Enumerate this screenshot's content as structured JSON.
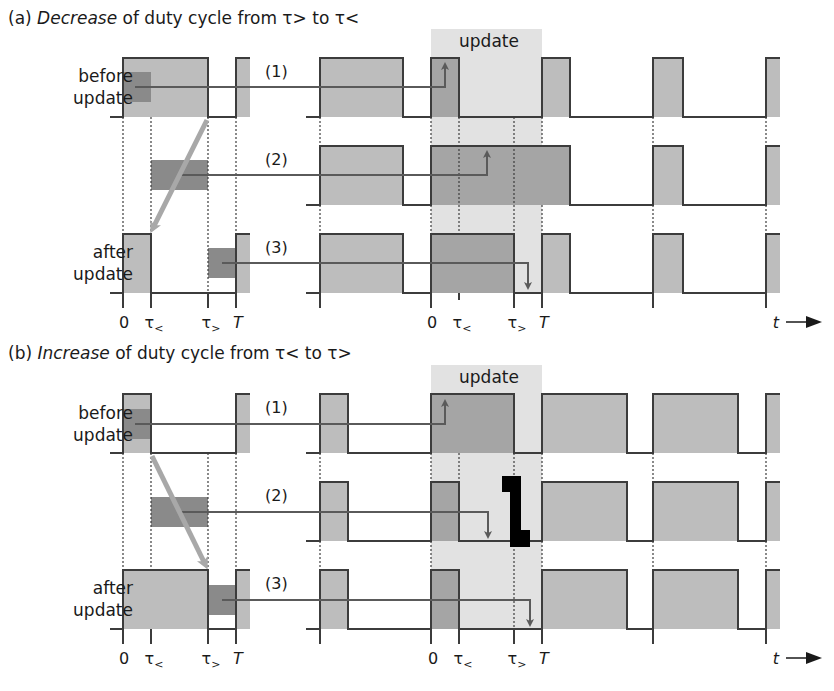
{
  "panel_a": {
    "title_prefix": "(a) ",
    "title_emph": "Decrease",
    "title_rest": " of duty cycle from τ> to τ<",
    "row_labels": {
      "before_1": "before",
      "before_2": "update",
      "after_1": "after",
      "after_2": "update"
    },
    "cases": [
      "(1)",
      "(2)",
      "(3)"
    ],
    "update_label": "update",
    "ticks_left": [
      "0",
      "τ<",
      "τ>",
      "T"
    ],
    "ticks_right": [
      "0",
      "τ<",
      "τ>",
      "T"
    ],
    "time_label": "t"
  },
  "panel_b": {
    "title_prefix": "(b) ",
    "title_emph": "Increase",
    "title_rest": " of duty cycle from τ< to τ>",
    "row_labels": {
      "before_1": "before",
      "before_2": "update",
      "after_1": "after",
      "after_2": "update"
    },
    "cases": [
      "(1)",
      "(2)",
      "(3)"
    ],
    "update_label": "update",
    "ticks_left": [
      "0",
      "τ<",
      "τ>",
      "T"
    ],
    "ticks_right": [
      "0",
      "τ<",
      "τ>",
      "T"
    ],
    "time_label": "t",
    "glitch_marker": "1"
  },
  "colors": {
    "pulse_fill": "#bdbdbd",
    "highlight_fill": "#8a8a8a",
    "update_band": "#e2e2e2",
    "line": "#3c3c3c",
    "arrow_light": "#a8a8a8",
    "arrow_dark": "#5a5a5a"
  }
}
